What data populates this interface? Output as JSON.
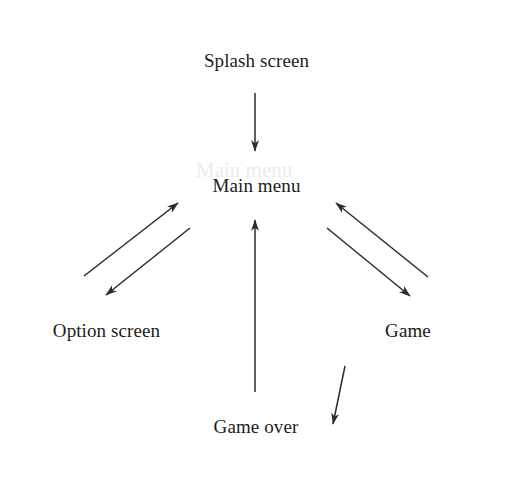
{
  "diagram": {
    "type": "flowchart",
    "background_color": "#ffffff",
    "stroke_color": "#2b2b2b",
    "text_color": "#1c1c1c",
    "nodes": [
      {
        "id": "splash",
        "label": "Splash screen",
        "x": 182,
        "y": 27,
        "w": 149,
        "h": 66
      },
      {
        "id": "main",
        "label": "Main menu",
        "x": 182,
        "y": 152,
        "w": 149,
        "h": 66
      },
      {
        "id": "option",
        "label": "Option screen",
        "x": 31,
        "y": 297,
        "w": 151,
        "h": 66
      },
      {
        "id": "game",
        "label": "Game",
        "x": 333,
        "y": 297,
        "w": 150,
        "h": 66
      },
      {
        "id": "gameover",
        "label": "Game over",
        "x": 182,
        "y": 393,
        "w": 148,
        "h": 67
      }
    ],
    "edges": [
      {
        "id": "splash-to-main",
        "from": "splash",
        "to": "main",
        "from_port": "bottom",
        "to_port": "top",
        "x1": 255,
        "y1": 93,
        "x2": 255,
        "y2": 151
      },
      {
        "id": "option-to-main",
        "from": "option",
        "to": "main",
        "from_port": "top",
        "to_port": "bottom",
        "x1": 84,
        "y1": 276,
        "x2": 178,
        "y2": 203
      },
      {
        "id": "main-to-option",
        "from": "main",
        "to": "option",
        "from_port": "bottom",
        "to_port": "top",
        "x1": 190,
        "y1": 228,
        "x2": 106,
        "y2": 295
      },
      {
        "id": "game-to-main",
        "from": "game",
        "to": "main",
        "from_port": "top",
        "to_port": "bottom",
        "x1": 428,
        "y1": 277,
        "x2": 336,
        "y2": 203
      },
      {
        "id": "main-to-game",
        "from": "main",
        "to": "game",
        "from_port": "bottom",
        "to_port": "top",
        "x1": 327,
        "y1": 228,
        "x2": 410,
        "y2": 296
      },
      {
        "id": "game-to-gameover",
        "from": "game",
        "to": "gameover",
        "from_port": "bottom",
        "to_port": "right",
        "x1": 345,
        "y1": 366,
        "x2": 333,
        "y2": 424
      },
      {
        "id": "gameover-to-main",
        "from": "gameover",
        "to": "main",
        "from_port": "top",
        "to_port": "bottom",
        "x1": 255,
        "y1": 392,
        "x2": 255,
        "y2": 220
      }
    ],
    "ghost_artifacts": [
      {
        "text": "Main menu",
        "x": 196,
        "y": 158
      },
      {
        "text": "screen",
        "x": 384,
        "y": 322
      }
    ]
  }
}
